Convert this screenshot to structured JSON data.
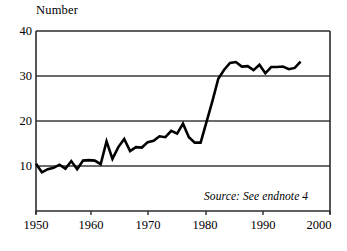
{
  "chart_data": {
    "type": "line",
    "title": "",
    "subtitle": "",
    "ylabel": "Number",
    "xlabel": "",
    "xlim": [
      1950,
      2000
    ],
    "ylim": [
      0,
      40
    ],
    "yticks": [
      10,
      20,
      30,
      40
    ],
    "xticks": [
      1950,
      1960,
      1970,
      1980,
      1990,
      2000
    ],
    "grid": "horizontal",
    "legend": "none",
    "annotations": [
      {
        "text": "Source: See endnote 4",
        "style": "italic",
        "position": "bottom-right-inside-plot"
      }
    ],
    "series": [
      {
        "name": "Number",
        "color": "#000000",
        "x": [
          1950,
          1951,
          1952,
          1953,
          1954,
          1955,
          1956,
          1957,
          1958,
          1959,
          1960,
          1961,
          1962,
          1963,
          1964,
          1965,
          1966,
          1967,
          1968,
          1969,
          1970,
          1971,
          1972,
          1973,
          1974,
          1975,
          1976,
          1977,
          1978,
          1979,
          1980,
          1981,
          1982,
          1983,
          1984,
          1985,
          1986,
          1987,
          1988,
          1989,
          1990,
          1991,
          1992,
          1993,
          1994,
          1995
        ],
        "values": [
          10.5,
          8.6,
          9.3,
          9.6,
          10.3,
          9.4,
          11.1,
          9.3,
          11.2,
          11.3,
          11.2,
          10.4,
          15.5,
          11.6,
          14.2,
          16.0,
          13.3,
          14.2,
          14.1,
          15.3,
          15.6,
          16.6,
          16.4,
          17.8,
          17.2,
          19.4,
          16.4,
          15.2,
          15.2,
          19.8,
          24.4,
          29.4,
          31.4,
          32.9,
          33.1,
          32.1,
          32.2,
          31.3,
          32.5,
          30.6,
          32.0,
          32.0,
          32.1,
          31.5,
          31.8,
          33.2
        ]
      }
    ]
  },
  "axis": {
    "y_label": "Number",
    "y_ticks": [
      "40",
      "30",
      "20",
      "10"
    ],
    "x_ticks": [
      "1950",
      "1960",
      "1970",
      "1980",
      "1990",
      "2000"
    ]
  },
  "source_note": "Source: See endnote 4",
  "colors": {
    "line": "#000000",
    "grid": "#3a3a3a",
    "frame": "#2b2b2b",
    "background": "#ffffff"
  }
}
